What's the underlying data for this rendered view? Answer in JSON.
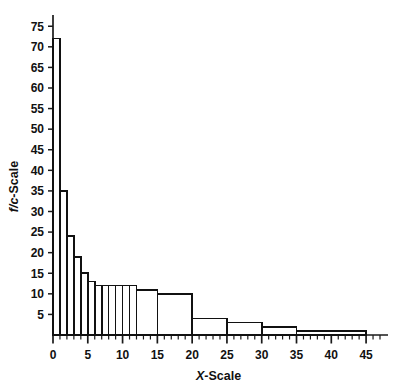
{
  "chart_data": {
    "type": "bar",
    "title": "",
    "subtitle": "",
    "xlabel": "X-Scale",
    "ylabel": "f/c-Scale",
    "ylabel_italic_part": "f/c",
    "ylabel_roman_part": "-Scale",
    "xlabel_italic_part": "X",
    "xlabel_roman_part": "-Scale",
    "xlim": [
      0,
      47
    ],
    "ylim": [
      0,
      77
    ],
    "grid": false,
    "legend": null,
    "y_ticks": [
      0,
      5,
      10,
      15,
      20,
      25,
      30,
      35,
      40,
      45,
      50,
      55,
      60,
      65,
      70,
      75
    ],
    "y_tick_labels": [
      "",
      "5",
      "10",
      "15",
      "20",
      "25",
      "30",
      "35",
      "40",
      "45",
      "50",
      "55",
      "60",
      "65",
      "70",
      "75"
    ],
    "x_ticks_major": [
      0,
      5,
      10,
      15,
      20,
      25,
      30,
      35,
      40,
      45
    ],
    "x_tick_labels": [
      "0",
      "5",
      "10",
      "15",
      "20",
      "25",
      "30",
      "35",
      "40",
      "45"
    ],
    "x_minor_tick_step": 1,
    "x_minor_tick_max": 47,
    "bar_edge_color": "#111111",
    "bar_fill_color": "#ffffff",
    "axis_color": "#1a1a1a",
    "bins": [
      {
        "x0": 0,
        "x1": 1,
        "height": 72
      },
      {
        "x0": 1,
        "x1": 2,
        "height": 35
      },
      {
        "x0": 2,
        "x1": 3,
        "height": 24
      },
      {
        "x0": 3,
        "x1": 4,
        "height": 19
      },
      {
        "x0": 4,
        "x1": 5,
        "height": 15
      },
      {
        "x0": 5,
        "x1": 6,
        "height": 13
      },
      {
        "x0": 6,
        "x1": 7,
        "height": 12
      },
      {
        "x0": 7,
        "x1": 8,
        "height": 12
      },
      {
        "x0": 8,
        "x1": 9,
        "height": 12
      },
      {
        "x0": 9,
        "x1": 10,
        "height": 12
      },
      {
        "x0": 10,
        "x1": 11,
        "height": 12
      },
      {
        "x0": 11,
        "x1": 12,
        "height": 12
      },
      {
        "x0": 12,
        "x1": 15,
        "height": 11
      },
      {
        "x0": 15,
        "x1": 20,
        "height": 10
      },
      {
        "x0": 20,
        "x1": 25,
        "height": 4
      },
      {
        "x0": 25,
        "x1": 30,
        "height": 3
      },
      {
        "x0": 30,
        "x1": 35,
        "height": 2
      },
      {
        "x0": 35,
        "x1": 45,
        "height": 1
      }
    ]
  }
}
